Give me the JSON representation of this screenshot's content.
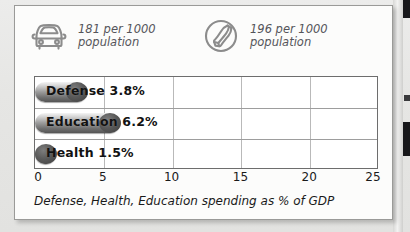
{
  "stats": [
    {
      "icon": "car-icon",
      "value": "181 per 1000",
      "unit": "population"
    },
    {
      "icon": "telephone-icon",
      "value": "196 per 1000",
      "unit": "population"
    }
  ],
  "caption": "Defense, Health, Education spending as % of GDP",
  "colors": {
    "card_background": "#fcfcfb",
    "card_border": "#9a9a98",
    "page_background": "#e9e9e7",
    "bar_dark": "#555555",
    "bar_light": "#f4f4f4",
    "text": "#1a1a1a",
    "stat_text": "#55555a",
    "gridline": "#b9b9b9"
  },
  "chart_data": {
    "type": "bar",
    "orientation": "horizontal",
    "title": "",
    "subtitle": "",
    "xlabel": "Defense, Health, Education spending as % of GDP",
    "ylabel": "",
    "categories": [
      "Defense",
      "Education",
      "Health"
    ],
    "values": [
      3.8,
      6.2,
      1.5
    ],
    "value_labels": [
      "3.8%",
      "6.2%",
      "1.5%"
    ],
    "bar_labels": [
      "Defense 3.8%",
      "Education 6.2%",
      "Health 1.5%"
    ],
    "xlim": [
      0,
      25
    ],
    "xticks": [
      0,
      5,
      10,
      15,
      20,
      25
    ],
    "xtick_labels": [
      "0",
      "5",
      "10",
      "15",
      "20",
      "25"
    ],
    "grid": true,
    "legend": false
  }
}
